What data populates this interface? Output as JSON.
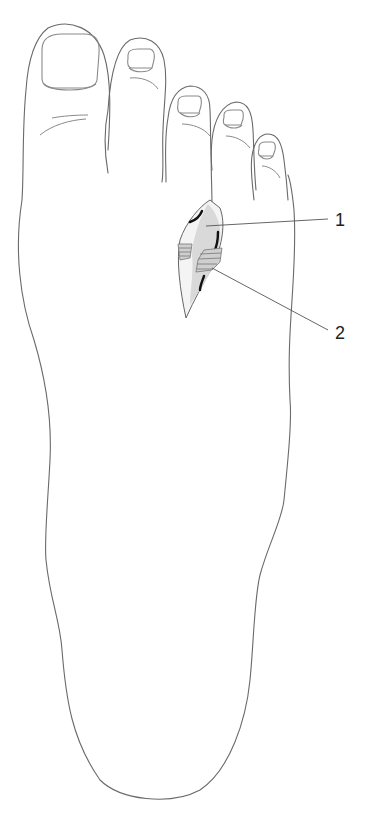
{
  "figure": {
    "callouts": [
      {
        "number": "1",
        "target": "exposed-nerve-region"
      },
      {
        "number": "2",
        "target": "hatched-ligament-region"
      }
    ]
  }
}
